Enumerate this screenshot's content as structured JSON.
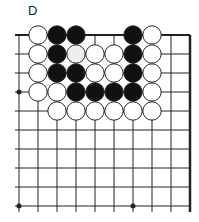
{
  "diagram": {
    "label": "D",
    "board": {
      "columns": 10,
      "rows": 10,
      "origin_x": 19,
      "origin_y": 35,
      "spacing": 19,
      "top_edge": true,
      "right_edge": true,
      "star_points": [
        [
          0,
          3
        ],
        [
          0,
          9
        ],
        [
          6,
          9
        ]
      ]
    },
    "stones": [
      {
        "color": "white",
        "col": 1,
        "row": 0
      },
      {
        "color": "black",
        "col": 2,
        "row": 0
      },
      {
        "color": "black",
        "col": 3,
        "row": 0
      },
      {
        "color": "black",
        "col": 6,
        "row": 0
      },
      {
        "color": "white",
        "col": 7,
        "row": 0
      },
      {
        "color": "white",
        "col": 1,
        "row": 1
      },
      {
        "color": "black",
        "col": 2,
        "row": 1
      },
      {
        "color": "white",
        "col": 3,
        "row": 1,
        "faded": true
      },
      {
        "color": "white",
        "col": 4,
        "row": 1
      },
      {
        "color": "white",
        "col": 5,
        "row": 1
      },
      {
        "color": "black",
        "col": 6,
        "row": 1
      },
      {
        "color": "white",
        "col": 7,
        "row": 1
      },
      {
        "color": "white",
        "col": 1,
        "row": 2
      },
      {
        "color": "black",
        "col": 2,
        "row": 2
      },
      {
        "color": "black",
        "col": 3,
        "row": 2
      },
      {
        "color": "white",
        "col": 4,
        "row": 2
      },
      {
        "color": "white",
        "col": 5,
        "row": 2
      },
      {
        "color": "black",
        "col": 6,
        "row": 2
      },
      {
        "color": "white",
        "col": 7,
        "row": 2
      },
      {
        "color": "white",
        "col": 1,
        "row": 3
      },
      {
        "color": "white",
        "col": 2,
        "row": 3
      },
      {
        "color": "black",
        "col": 3,
        "row": 3
      },
      {
        "color": "black",
        "col": 4,
        "row": 3
      },
      {
        "color": "black",
        "col": 5,
        "row": 3
      },
      {
        "color": "black",
        "col": 6,
        "row": 3
      },
      {
        "color": "white",
        "col": 7,
        "row": 3
      },
      {
        "color": "white",
        "col": 2,
        "row": 4
      },
      {
        "color": "white",
        "col": 3,
        "row": 4
      },
      {
        "color": "white",
        "col": 4,
        "row": 4
      },
      {
        "color": "white",
        "col": 5,
        "row": 4
      },
      {
        "color": "white",
        "col": 6,
        "row": 4
      },
      {
        "color": "white",
        "col": 7,
        "row": 4
      }
    ],
    "colors": {
      "line": "#222222",
      "black_stone": "#111111",
      "white_stone": "#ffffff",
      "faded_white_fill": "#eeeeee"
    }
  }
}
